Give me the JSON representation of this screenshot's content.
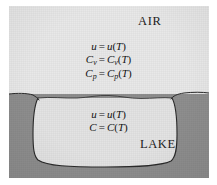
{
  "figure": {
    "caption_labels": {
      "air": "AIR",
      "lake": "LAKE"
    },
    "regions": {
      "air": {
        "name": "AIR",
        "fill_color": "#e8e8e8",
        "equations": [
          {
            "lhs": "u",
            "operator": "=",
            "rhs_fn": "u",
            "rhs_arg": "T",
            "text": "u = u(T)"
          },
          {
            "lhs": "C",
            "lhs_sub": "v",
            "operator": "=",
            "rhs_fn": "C",
            "rhs_fn_sub": "v",
            "rhs_arg": "T",
            "text": "Cv = Cv(T)"
          },
          {
            "lhs": "C",
            "lhs_sub": "p",
            "operator": "=",
            "rhs_fn": "C",
            "rhs_fn_sub": "p",
            "rhs_arg": "T",
            "text": "Cp = Cp(T)"
          }
        ]
      },
      "lake": {
        "name": "LAKE",
        "fill_color": "#e3e3e3",
        "equations": [
          {
            "lhs": "u",
            "operator": "=",
            "rhs_fn": "u",
            "rhs_arg": "T",
            "text": "u = u(T)"
          },
          {
            "lhs": "C",
            "operator": "=",
            "rhs_fn": "C",
            "rhs_arg": "T",
            "text": "C = C(T)"
          }
        ]
      },
      "ground": {
        "name": "GROUND",
        "fill_color": "#8e8e8e"
      }
    },
    "colors": {
      "background": "#ffffff",
      "air_fill": "#e8e8e8",
      "water_fill": "#e3e3e3",
      "ground_fill": "#8e8e8e",
      "outline": "#2a2a2a",
      "text": "#1d1d1d"
    },
    "symbols": {
      "u": "u",
      "C_v": "Cv",
      "C_p": "Cp",
      "C": "C",
      "T": "T",
      "equals": "="
    }
  },
  "equations_air": {
    "line1": {
      "lhs": "u",
      "eq": "=",
      "fn": "u",
      "open": "(",
      "arg": "T",
      "close": ")"
    },
    "line2": {
      "lhs": "C",
      "sub": "v",
      "eq": "=",
      "fn": "C",
      "fnsub": "v",
      "open": "(",
      "arg": "T",
      "close": ")"
    },
    "line3": {
      "lhs": "C",
      "sub": "p",
      "eq": "=",
      "fn": "C",
      "fnsub": "p",
      "open": "(",
      "arg": "T",
      "close": ")"
    }
  },
  "equations_lake": {
    "line1": {
      "lhs": "u",
      "eq": "=",
      "fn": "u",
      "open": "(",
      "arg": "T",
      "close": ")"
    },
    "line2": {
      "lhs": "C",
      "eq": "=",
      "fn": "C",
      "open": "(",
      "arg": "T",
      "close": ")"
    }
  }
}
